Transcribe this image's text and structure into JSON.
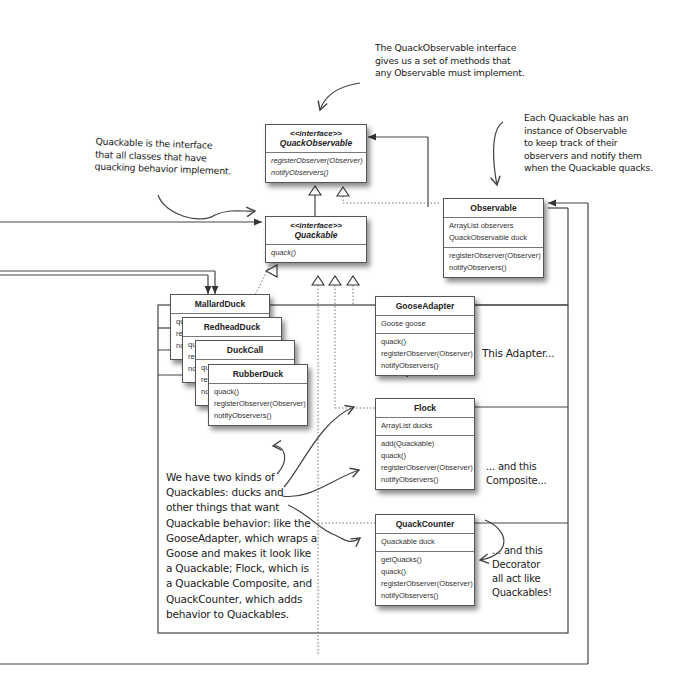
{
  "diagram": {
    "type": "uml-class-diagram",
    "classes": {
      "quack_observable": {
        "stereotype": "<<interface>>",
        "name": "QuackObservable",
        "attributes": [],
        "methods": [
          "registerObserver(Observer)",
          "notifyObservers()"
        ]
      },
      "quackable": {
        "stereotype": "<<interface>>",
        "name": "Quackable",
        "attributes": [],
        "methods": [
          "quack()"
        ]
      },
      "observable": {
        "name": "Observable",
        "attributes": [
          "ArrayList observers",
          "QuackObservable duck"
        ],
        "methods": [
          "registerObserver(Observer)",
          "notifyObservers()"
        ]
      },
      "mallard_duck": {
        "name": "MallardDuck",
        "methods_partial": [
          "qu",
          "re",
          "no"
        ]
      },
      "redhead_duck": {
        "name": "RedheadDuck",
        "methods_partial": [
          "qu",
          "re",
          "no"
        ]
      },
      "duck_call": {
        "name": "DuckCall",
        "methods_partial": [
          "qu",
          "re",
          "no"
        ]
      },
      "rubber_duck": {
        "name": "RubberDuck",
        "methods": [
          "quack()",
          "registerObserver(Observer)",
          "notifyObservers()"
        ]
      },
      "goose_adapter": {
        "name": "GooseAdapter",
        "attributes": [
          "Goose goose"
        ],
        "methods": [
          "quack()",
          "registerObserver(Observer)",
          "notifyObservers()"
        ]
      },
      "flock": {
        "name": "Flock",
        "attributes": [
          "ArrayList ducks"
        ],
        "methods": [
          "add(Quackable)",
          "quack()",
          "registerObserver(Observer)",
          "notifyObservers()"
        ]
      },
      "quack_counter": {
        "name": "QuackCounter",
        "attributes": [
          "Quackable duck"
        ],
        "methods": [
          "getQuacks()",
          "quack()",
          "registerObserver(Observer)",
          "notifyObservers()"
        ]
      }
    },
    "annotations": {
      "quackobservable_note": [
        "The QuackObservable interface",
        "gives us a set of methods that",
        "any Observable must implement."
      ],
      "observable_note": [
        "Each Quackable has an",
        "instance of Observable",
        "to keep track of their",
        "observers and notify them",
        "when the Quackable quacks."
      ],
      "quackable_note": [
        "Quackable is the interface",
        "that all classes that have",
        "quacking behavior implement."
      ],
      "adapter_note": [
        "This Adapter..."
      ],
      "composite_note": [
        "... and this",
        "Composite..."
      ],
      "decorator_note": [
        "... and this",
        "Decorator",
        "all act like",
        "Quackables!"
      ],
      "kinds_note": [
        "We have two kinds of",
        "Quackables: ducks and",
        "other things that want",
        "Quackable behavior: like the",
        "GooseAdapter, which wraps a",
        "Goose and makes it look like",
        "a Quackable; Flock, which is",
        "a Quackable Composite, and",
        "QuackCounter, which adds",
        "behavior to Quackables."
      ]
    }
  }
}
